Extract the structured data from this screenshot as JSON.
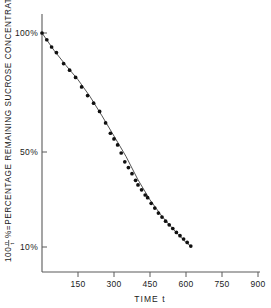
{
  "figure": {
    "name": "sucrose-decay-semilog-plot",
    "background_color": "#ffffff",
    "ink_color": "#1a1a1a"
  },
  "axes": {
    "y_title_parts": {
      "lead": "100",
      "numerator": "n",
      "denominator": "t",
      "rest": "%=PERCENTAGE REMAINING SUCROSE CONCENTRATION"
    },
    "y_title_full": "100 n/t %=PERCENTAGE REMAINING SUCROSE CONCENTRATION",
    "x_title": "TIME  t",
    "y_ticks": [
      {
        "label": "100%",
        "value": 100
      },
      {
        "label": "50%",
        "value": 50
      },
      {
        "label": "10%",
        "value": 10
      }
    ],
    "x_ticks": [
      {
        "label": "150",
        "value": 150
      },
      {
        "label": "300",
        "value": 300
      },
      {
        "label": "450",
        "value": 450
      },
      {
        "label": "600",
        "value": 600
      },
      {
        "label": "750",
        "value": 750
      },
      {
        "label": "900",
        "value": 900
      }
    ]
  },
  "chart_data": {
    "type": "scatter",
    "title": "",
    "subtitle": "",
    "xlabel": "TIME  t",
    "ylabel": "100 n/t %=PERCENTAGE REMAINING SUCROSE CONCENTRATION",
    "xlim": [
      0,
      900
    ],
    "ylim": [
      9,
      115
    ],
    "yscale": "log",
    "xscale": "linear",
    "grid": false,
    "legend": false,
    "legend_position": "none",
    "xticks": [
      150,
      300,
      450,
      600,
      750,
      900
    ],
    "yticks": [
      10,
      50,
      100
    ],
    "ytick_labels": [
      "10%",
      "50%",
      "100%"
    ],
    "annotations": [],
    "series": [
      {
        "name": "observed sucrose concentration",
        "marker": "filled-circle",
        "marker_color": "#101010",
        "x": [
          0,
          20,
          40,
          60,
          90,
          115,
          140,
          165,
          190,
          215,
          240,
          265,
          285,
          300,
          315,
          330,
          345,
          360,
          375,
          390,
          400,
          415,
          430,
          440,
          455,
          470,
          485,
          500,
          515,
          530,
          545,
          560,
          575,
          590,
          605,
          620
        ],
        "y": [
          100,
          93,
          86,
          81,
          72,
          67,
          62,
          56,
          51,
          47,
          43,
          38,
          34,
          32,
          30,
          27.5,
          25,
          23.5,
          22,
          20.5,
          19.5,
          18.5,
          17.5,
          17,
          16,
          15.2,
          14.4,
          13.8,
          13.2,
          12.7,
          12.2,
          11.7,
          11.3,
          10.9,
          10.5,
          10.1
        ]
      },
      {
        "name": "fitted exponential decay curve",
        "marker": "none",
        "line_color": "#404040",
        "x": [
          0,
          50,
          100,
          150,
          200,
          250,
          300,
          350,
          400,
          450,
          500,
          550,
          600,
          625
        ],
        "y": [
          100,
          83,
          70.5,
          60.5,
          50.5,
          41,
          33,
          26.5,
          20.6,
          16.6,
          13.9,
          12.0,
          10.5,
          10.0
        ]
      }
    ]
  }
}
